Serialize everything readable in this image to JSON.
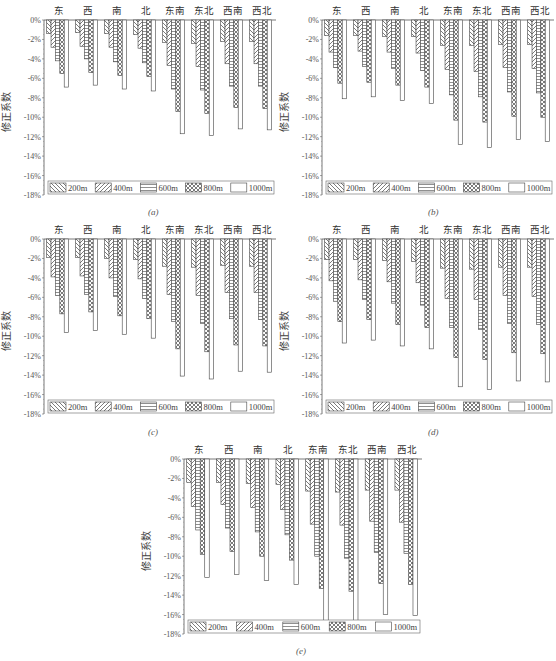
{
  "figure": {
    "ylabel": "修正系数",
    "categories": [
      "东",
      "西",
      "南",
      "北",
      "东南",
      "东北",
      "西南",
      "西北"
    ],
    "legend": [
      "200m",
      "400m",
      "600m",
      "800m",
      "1000m"
    ],
    "legend_patterns": [
      "backslash-hatch",
      "forward-slash-hatch",
      "horizontal-lines",
      "crosshatch",
      "empty"
    ],
    "yticks": [
      "0%",
      "-2%",
      "-4%",
      "-6%",
      "-8%",
      "-10%",
      "-12%",
      "-14%",
      "-16%",
      "-18%"
    ],
    "panel_labels": [
      "(a)",
      "(b)",
      "(c)",
      "(d)",
      "(e)"
    ]
  },
  "chart_data": [
    {
      "type": "bar",
      "panel": "(a)",
      "title": "",
      "xlabel": "",
      "ylabel": "修正系数",
      "ylim": [
        -18,
        0
      ],
      "categories": [
        "东",
        "西",
        "南",
        "北",
        "东南",
        "东北",
        "西南",
        "西北"
      ],
      "series": [
        {
          "name": "200m",
          "values": [
            -1.4,
            -1.3,
            -1.4,
            -1.5,
            -2.3,
            -2.4,
            -2.2,
            -2.2
          ]
        },
        {
          "name": "400m",
          "values": [
            -2.8,
            -2.7,
            -2.8,
            -2.9,
            -4.7,
            -4.8,
            -4.5,
            -4.5
          ]
        },
        {
          "name": "600m",
          "values": [
            -4.2,
            -4.0,
            -4.3,
            -4.4,
            -7.1,
            -7.2,
            -6.8,
            -6.8
          ]
        },
        {
          "name": "800m",
          "values": [
            -5.5,
            -5.4,
            -5.7,
            -5.8,
            -9.4,
            -9.6,
            -9.0,
            -9.1
          ]
        },
        {
          "name": "1000m",
          "values": [
            -6.9,
            -6.7,
            -7.1,
            -7.3,
            -11.7,
            -11.9,
            -11.2,
            -11.3
          ]
        }
      ]
    },
    {
      "type": "bar",
      "panel": "(b)",
      "title": "",
      "xlabel": "",
      "ylabel": "修正系数",
      "ylim": [
        -18,
        0
      ],
      "categories": [
        "东",
        "西",
        "南",
        "北",
        "东南",
        "东北",
        "西南",
        "西北"
      ],
      "series": [
        {
          "name": "200m",
          "values": [
            -1.6,
            -1.6,
            -1.7,
            -1.7,
            -2.6,
            -2.6,
            -2.5,
            -2.5
          ]
        },
        {
          "name": "400m",
          "values": [
            -3.3,
            -3.2,
            -3.3,
            -3.4,
            -5.1,
            -5.3,
            -4.9,
            -5.0
          ]
        },
        {
          "name": "600m",
          "values": [
            -4.9,
            -4.8,
            -5.0,
            -5.2,
            -7.7,
            -7.9,
            -7.4,
            -7.5
          ]
        },
        {
          "name": "800m",
          "values": [
            -6.5,
            -6.4,
            -6.7,
            -6.9,
            -10.3,
            -10.5,
            -9.9,
            -10.0
          ]
        },
        {
          "name": "1000m",
          "values": [
            -8.1,
            -7.9,
            -8.3,
            -8.6,
            -12.8,
            -13.1,
            -12.3,
            -12.5
          ]
        }
      ]
    },
    {
      "type": "bar",
      "panel": "(c)",
      "title": "",
      "xlabel": "",
      "ylabel": "修正系数",
      "ylim": [
        -18,
        0
      ],
      "categories": [
        "东",
        "西",
        "南",
        "北",
        "东南",
        "东北",
        "西南",
        "西北"
      ],
      "series": [
        {
          "name": "200m",
          "values": [
            -1.9,
            -1.9,
            -2.0,
            -2.1,
            -2.8,
            -2.9,
            -2.7,
            -2.8
          ]
        },
        {
          "name": "400m",
          "values": [
            -3.9,
            -3.8,
            -4.0,
            -4.1,
            -5.7,
            -5.8,
            -5.5,
            -5.5
          ]
        },
        {
          "name": "600m",
          "values": [
            -5.8,
            -5.7,
            -5.9,
            -6.1,
            -8.5,
            -8.7,
            -8.2,
            -8.3
          ]
        },
        {
          "name": "800m",
          "values": [
            -7.7,
            -7.5,
            -7.9,
            -8.2,
            -11.3,
            -11.6,
            -10.9,
            -11.0
          ]
        },
        {
          "name": "1000m",
          "values": [
            -9.6,
            -9.4,
            -9.8,
            -10.2,
            -14.1,
            -14.4,
            -13.6,
            -13.7
          ]
        }
      ]
    },
    {
      "type": "bar",
      "panel": "(d)",
      "title": "",
      "xlabel": "",
      "ylabel": "修正系数",
      "ylim": [
        -18,
        0
      ],
      "categories": [
        "东",
        "西",
        "南",
        "北",
        "东南",
        "东北",
        "西南",
        "西北"
      ],
      "series": [
        {
          "name": "200m",
          "values": [
            -2.1,
            -2.1,
            -2.2,
            -2.3,
            -3.0,
            -3.1,
            -2.9,
            -2.9
          ]
        },
        {
          "name": "400m",
          "values": [
            -4.3,
            -4.2,
            -4.4,
            -4.5,
            -6.1,
            -6.2,
            -5.8,
            -5.9
          ]
        },
        {
          "name": "600m",
          "values": [
            -6.4,
            -6.2,
            -6.6,
            -6.8,
            -9.1,
            -9.3,
            -8.7,
            -8.8
          ]
        },
        {
          "name": "800m",
          "values": [
            -8.5,
            -8.3,
            -8.8,
            -9.1,
            -12.2,
            -12.4,
            -11.7,
            -11.8
          ]
        },
        {
          "name": "1000m",
          "values": [
            -10.7,
            -10.4,
            -11.0,
            -11.3,
            -15.2,
            -15.5,
            -14.6,
            -14.7
          ]
        }
      ]
    },
    {
      "type": "bar",
      "panel": "(e)",
      "title": "",
      "xlabel": "",
      "ylabel": "修正系数",
      "ylim": [
        -18,
        0
      ],
      "categories": [
        "东",
        "西",
        "南",
        "北",
        "东南",
        "东北",
        "西南",
        "西北"
      ],
      "series": [
        {
          "name": "200m",
          "values": [
            -2.4,
            -2.4,
            -2.5,
            -2.6,
            -3.3,
            -3.4,
            -3.2,
            -3.2
          ]
        },
        {
          "name": "400m",
          "values": [
            -4.9,
            -4.7,
            -5.0,
            -5.2,
            -6.7,
            -6.8,
            -6.4,
            -6.5
          ]
        },
        {
          "name": "600m",
          "values": [
            -7.3,
            -7.1,
            -7.5,
            -7.8,
            -10.0,
            -10.2,
            -9.6,
            -9.7
          ]
        },
        {
          "name": "800m",
          "values": [
            -9.8,
            -9.5,
            -10.0,
            -10.4,
            -13.3,
            -13.6,
            -12.8,
            -12.9
          ]
        },
        {
          "name": "1000m",
          "values": [
            -12.2,
            -11.9,
            -12.5,
            -12.9,
            -16.6,
            -17.0,
            -16.0,
            -16.1
          ]
        }
      ]
    }
  ]
}
